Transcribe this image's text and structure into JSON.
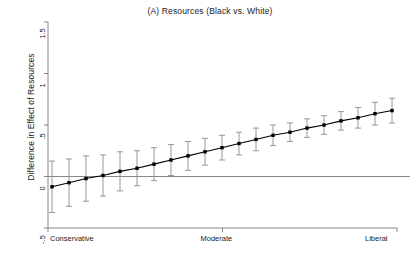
{
  "chart_data": {
    "type": "line",
    "title": "(A) Resources (Black vs. White)",
    "xlabel": "",
    "ylabel": "Difference in Effect of Resources",
    "grid": false,
    "legend": "none",
    "xlim": [
      0,
      20
    ],
    "ylim": [
      -0.5,
      1.5
    ],
    "ytick_labels": [
      "-.5",
      "0",
      ".5",
      "1",
      "1.5"
    ],
    "ytick_values": [
      -0.5,
      0,
      0.5,
      1,
      1.5
    ],
    "xtick_labels": [
      "Conservative",
      "Moderate",
      "Liberal"
    ],
    "xtick_values": [
      0,
      10,
      20
    ],
    "reference_line": 0,
    "marker": "filled-square",
    "error_bar_style": "capped-vertical",
    "x": [
      0,
      1,
      2,
      3,
      4,
      5,
      6,
      7,
      8,
      9,
      10,
      11,
      12,
      13,
      14,
      15,
      16,
      17,
      18,
      19,
      20
    ],
    "values": [
      -0.1,
      -0.06,
      -0.02,
      0.01,
      0.05,
      0.08,
      0.12,
      0.16,
      0.2,
      0.24,
      0.28,
      0.32,
      0.36,
      0.4,
      0.43,
      0.47,
      0.5,
      0.54,
      0.57,
      0.61,
      0.64
    ],
    "ci_lower": [
      -0.35,
      -0.29,
      -0.24,
      -0.19,
      -0.14,
      -0.09,
      -0.04,
      0.01,
      0.06,
      0.11,
      0.16,
      0.21,
      0.25,
      0.3,
      0.34,
      0.38,
      0.41,
      0.45,
      0.47,
      0.5,
      0.52
    ],
    "ci_upper": [
      0.15,
      0.17,
      0.2,
      0.21,
      0.24,
      0.25,
      0.28,
      0.31,
      0.34,
      0.37,
      0.4,
      0.43,
      0.47,
      0.5,
      0.52,
      0.56,
      0.59,
      0.63,
      0.67,
      0.72,
      0.76
    ],
    "series": [
      {
        "name": "Difference in Effect of Resources",
        "values": [
          -0.1,
          -0.06,
          -0.02,
          0.01,
          0.05,
          0.08,
          0.12,
          0.16,
          0.2,
          0.24,
          0.28,
          0.32,
          0.36,
          0.4,
          0.43,
          0.47,
          0.5,
          0.54,
          0.57,
          0.61,
          0.64
        ]
      }
    ],
    "colors": {
      "line": "#000000",
      "marker": "#000000",
      "error_bar": "#8c8c8c",
      "axis": "#7a7a7a",
      "reference_line": "#7a7a7a",
      "background": "#ffffff"
    }
  }
}
